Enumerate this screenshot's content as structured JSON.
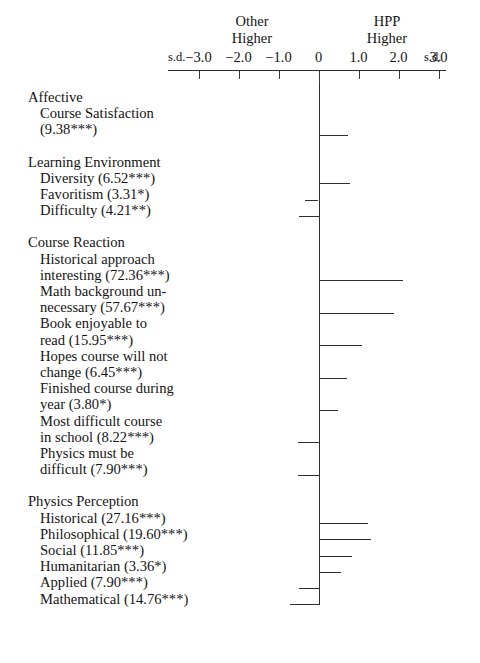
{
  "figure": {
    "left_caption": {
      "line1": "Other",
      "line2": "Higher"
    },
    "right_caption": {
      "line1": "HPP",
      "line2": "Higher"
    },
    "axis_unit_left": "s.d.",
    "axis_unit_right": "s.d.",
    "axis_tick_labels": [
      "−3.0",
      "−2.0",
      "−1.0",
      "0",
      "1.0",
      "2.0",
      "3.0"
    ]
  },
  "chart_data": {
    "type": "bar",
    "orientation": "horizontal",
    "title": "",
    "xlabel": "s.d.",
    "ylabel": "",
    "xlim": [
      -3.5,
      3.5
    ],
    "grid": false,
    "legend": null,
    "axis_ticks": [
      -3.0,
      -2.0,
      -1.0,
      0,
      1.0,
      2.0,
      3.0
    ],
    "axis_tick_labels": [
      "-3.0",
      "-2.0",
      "-1.0",
      "0",
      "1.0",
      "2.0",
      "3.0"
    ],
    "left_pole_label": "Other Higher",
    "right_pole_label": "HPP Higher",
    "units": "s.d.",
    "groups": [
      {
        "name": "Affective",
        "items": [
          {
            "label_lines": [
              "Course Satisfaction",
              "(9.38***)"
            ],
            "name": "Course Satisfaction",
            "statistic": 9.38,
            "significance": "***",
            "value": 0.72
          }
        ]
      },
      {
        "name": "Learning Environment",
        "items": [
          {
            "label_lines": [
              "Diversity (6.52***)"
            ],
            "name": "Diversity",
            "statistic": 6.52,
            "significance": "***",
            "value": 0.77
          },
          {
            "label_lines": [
              "Favoritism (3.31*)"
            ],
            "name": "Favoritism",
            "statistic": 3.31,
            "significance": "*",
            "value": -0.33
          },
          {
            "label_lines": [
              "Difficulty (4.21**)"
            ],
            "name": "Difficulty",
            "statistic": 4.21,
            "significance": "**",
            "value": -0.5
          }
        ]
      },
      {
        "name": "Course Reaction",
        "items": [
          {
            "label_lines": [
              "Historical approach",
              "interesting (72.36***)"
            ],
            "name": "Historical approach interesting",
            "statistic": 72.36,
            "significance": "***",
            "value": 2.1
          },
          {
            "label_lines": [
              "Math background un-",
              "necessary (57.67***)"
            ],
            "name": "Math background unnecessary",
            "statistic": 57.67,
            "significance": "***",
            "value": 1.87
          },
          {
            "label_lines": [
              "Book enjoyable to",
              "read (15.95***)"
            ],
            "name": "Book enjoyable to read",
            "statistic": 15.95,
            "significance": "***",
            "value": 1.07
          },
          {
            "label_lines": [
              "Hopes course will not",
              "change (6.45***)"
            ],
            "name": "Hopes course will not change",
            "statistic": 6.45,
            "significance": "***",
            "value": 0.7
          },
          {
            "label_lines": [
              "Finished course during",
              "year (3.80*)"
            ],
            "name": "Finished course during year",
            "statistic": 3.8,
            "significance": "*",
            "value": 0.48
          },
          {
            "label_lines": [
              "Most difficult course",
              "in school (8.22***)"
            ],
            "name": "Most difficult course in school",
            "statistic": 8.22,
            "significance": "***",
            "value": -0.52
          },
          {
            "label_lines": [
              "Physics must be",
              "difficult (7.90***)"
            ],
            "name": "Physics must be difficult",
            "statistic": 7.9,
            "significance": "***",
            "value": -0.52
          }
        ]
      },
      {
        "name": "Physics Perception",
        "items": [
          {
            "label_lines": [
              "Historical (27.16***)"
            ],
            "name": "Historical",
            "statistic": 27.16,
            "significance": "***",
            "value": 1.22
          },
          {
            "label_lines": [
              "Philosophical (19.60***)"
            ],
            "name": "Philosophical",
            "statistic": 19.6,
            "significance": "***",
            "value": 1.3
          },
          {
            "label_lines": [
              "Social (11.85***)"
            ],
            "name": "Social",
            "statistic": 11.85,
            "significance": "***",
            "value": 0.83
          },
          {
            "label_lines": [
              "Humanitarian (3.36*)"
            ],
            "name": "Humanitarian",
            "statistic": 3.36,
            "significance": "*",
            "value": 0.55
          },
          {
            "label_lines": [
              "Applied (7.90***)"
            ],
            "name": "Applied",
            "statistic": 7.9,
            "significance": "***",
            "value": -0.5
          },
          {
            "label_lines": [
              "Mathematical (14.76***)"
            ],
            "name": "Mathematical",
            "statistic": 14.76,
            "significance": "***",
            "value": -0.72
          }
        ]
      }
    ]
  }
}
